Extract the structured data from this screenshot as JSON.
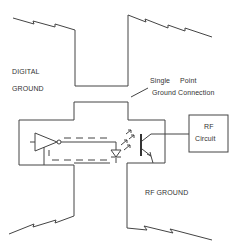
{
  "diagram": {
    "labels": {
      "digital_ground_line1": "DIGITAL",
      "digital_ground_line2": "GROUND",
      "single_point_line1a": "Single",
      "single_point_line1b": "Point",
      "single_point_line2": "Ground Connection",
      "rf_ground": "RF GROUND",
      "rf_circuit_line1": "RF",
      "rf_circuit_line2": "Circuit"
    },
    "components": [
      {
        "id": "buffer",
        "type": "buffer-amplifier"
      },
      {
        "id": "led",
        "type": "light-emitting-diode"
      },
      {
        "id": "phototransistor",
        "type": "phototransistor"
      },
      {
        "id": "rf-circuit",
        "type": "block"
      }
    ],
    "colors": {
      "line": "#444444",
      "text": "#333333",
      "background": "#ffffff"
    }
  }
}
